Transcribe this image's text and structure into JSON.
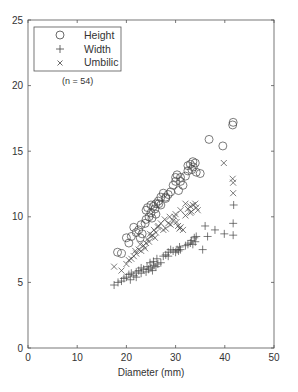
{
  "chart_data": {
    "type": "scatter",
    "title": "",
    "xlabel": "Diameter (mm)",
    "ylabel": "",
    "xlim": [
      0,
      50
    ],
    "ylim": [
      0,
      25
    ],
    "xticks": [
      0,
      10,
      20,
      30,
      40,
      50
    ],
    "yticks": [
      0,
      5,
      10,
      15,
      20,
      25
    ],
    "grid": false,
    "legend_position": "upper-left",
    "annotation": "(n = 54)",
    "series": [
      {
        "name": "Height",
        "marker": "circle",
        "points": [
          [
            18.2,
            7.3
          ],
          [
            19.0,
            7.2
          ],
          [
            20.0,
            8.4
          ],
          [
            20.5,
            8.0
          ],
          [
            21.0,
            8.5
          ],
          [
            21.5,
            9.2
          ],
          [
            22.0,
            8.8
          ],
          [
            22.5,
            9.0
          ],
          [
            23.0,
            9.4
          ],
          [
            23.2,
            8.7
          ],
          [
            23.8,
            9.5
          ],
          [
            24.0,
            9.8
          ],
          [
            24.3,
            10.7
          ],
          [
            24.6,
            10.0
          ],
          [
            25.0,
            10.3
          ],
          [
            25.2,
            9.9
          ],
          [
            25.5,
            10.8
          ],
          [
            25.8,
            10.6
          ],
          [
            26.0,
            11.0
          ],
          [
            26.5,
            11.2
          ],
          [
            27.0,
            11.5
          ],
          [
            27.5,
            11.8
          ],
          [
            28.0,
            11.4
          ],
          [
            28.5,
            11.7
          ],
          [
            29.0,
            11.9
          ],
          [
            29.5,
            12.4
          ],
          [
            30.0,
            12.7
          ],
          [
            30.3,
            13.2
          ],
          [
            30.6,
            12.0
          ],
          [
            31.0,
            13.0
          ],
          [
            31.5,
            12.4
          ],
          [
            32.0,
            13.1
          ],
          [
            32.5,
            13.5
          ],
          [
            33.0,
            14.0
          ],
          [
            33.3,
            13.6
          ],
          [
            33.6,
            13.8
          ],
          [
            34.0,
            14.1
          ],
          [
            34.2,
            13.4
          ],
          [
            35.0,
            13.3
          ],
          [
            36.8,
            15.9
          ],
          [
            39.6,
            15.4
          ],
          [
            41.6,
            17.0
          ],
          [
            41.7,
            17.2
          ],
          [
            24.0,
            10.5
          ],
          [
            25.0,
            10.9
          ],
          [
            26.0,
            10.2
          ],
          [
            27.0,
            10.9
          ],
          [
            28.0,
            11.5
          ],
          [
            30.0,
            13.0
          ],
          [
            31.0,
            12.7
          ],
          [
            32.5,
            13.9
          ],
          [
            33.5,
            14.2
          ],
          [
            22.8,
            8.4
          ],
          [
            26.6,
            11.0
          ]
        ]
      },
      {
        "name": "Width",
        "marker": "plus",
        "points": [
          [
            17.5,
            4.8
          ],
          [
            18.3,
            5.0
          ],
          [
            19.0,
            5.1
          ],
          [
            19.5,
            5.3
          ],
          [
            20.0,
            5.4
          ],
          [
            20.5,
            5.6
          ],
          [
            21.0,
            5.7
          ],
          [
            21.5,
            5.5
          ],
          [
            22.0,
            5.8
          ],
          [
            22.5,
            5.9
          ],
          [
            23.0,
            5.7
          ],
          [
            23.5,
            6.0
          ],
          [
            24.0,
            5.8
          ],
          [
            24.2,
            6.2
          ],
          [
            24.5,
            6.0
          ],
          [
            25.0,
            6.1
          ],
          [
            25.3,
            5.9
          ],
          [
            25.6,
            6.3
          ],
          [
            26.0,
            6.2
          ],
          [
            26.4,
            6.4
          ],
          [
            27.0,
            6.5
          ],
          [
            27.5,
            7.0
          ],
          [
            28.0,
            7.1
          ],
          [
            28.5,
            7.3
          ],
          [
            29.0,
            7.5
          ],
          [
            30.0,
            7.3
          ],
          [
            30.3,
            7.5
          ],
          [
            30.6,
            7.4
          ],
          [
            31.0,
            7.5
          ],
          [
            32.0,
            7.8
          ],
          [
            32.5,
            7.9
          ],
          [
            33.0,
            8.0
          ],
          [
            33.2,
            8.2
          ],
          [
            33.5,
            7.9
          ],
          [
            34.0,
            8.1
          ],
          [
            34.2,
            8.5
          ],
          [
            35.5,
            7.5
          ],
          [
            36.5,
            8.5
          ],
          [
            38.0,
            9.0
          ],
          [
            39.9,
            8.7
          ],
          [
            41.7,
            8.6
          ],
          [
            41.7,
            9.5
          ],
          [
            41.8,
            10.9
          ],
          [
            36.0,
            9.3
          ],
          [
            23.0,
            6.1
          ],
          [
            24.8,
            6.5
          ],
          [
            26.2,
            6.8
          ],
          [
            22.0,
            5.4
          ],
          [
            28.5,
            7.0
          ],
          [
            33.8,
            8.4
          ],
          [
            20.8,
            5.2
          ],
          [
            25.5,
            6.6
          ],
          [
            30.8,
            7.7
          ],
          [
            29.5,
            7.4
          ]
        ]
      },
      {
        "name": "Umbilic",
        "marker": "x",
        "points": [
          [
            17.5,
            6.2
          ],
          [
            19.0,
            5.9
          ],
          [
            20.0,
            6.4
          ],
          [
            20.5,
            6.7
          ],
          [
            21.0,
            6.8
          ],
          [
            21.5,
            7.0
          ],
          [
            22.0,
            7.2
          ],
          [
            22.5,
            7.5
          ],
          [
            23.0,
            7.4
          ],
          [
            23.5,
            7.8
          ],
          [
            24.0,
            8.0
          ],
          [
            24.3,
            8.3
          ],
          [
            24.6,
            8.1
          ],
          [
            25.0,
            8.5
          ],
          [
            25.3,
            8.6
          ],
          [
            25.6,
            9.0
          ],
          [
            26.0,
            8.8
          ],
          [
            26.4,
            9.2
          ],
          [
            27.0,
            9.5
          ],
          [
            27.5,
            9.0
          ],
          [
            28.0,
            9.1
          ],
          [
            28.5,
            9.5
          ],
          [
            29.0,
            9.4
          ],
          [
            29.5,
            9.7
          ],
          [
            30.0,
            10.2
          ],
          [
            30.5,
            9.3
          ],
          [
            30.8,
            9.1
          ],
          [
            31.0,
            9.2
          ],
          [
            31.5,
            9.0
          ],
          [
            32.0,
            10.1
          ],
          [
            32.5,
            10.6
          ],
          [
            33.0,
            10.8
          ],
          [
            33.2,
            10.4
          ],
          [
            33.5,
            10.9
          ],
          [
            34.0,
            11.0
          ],
          [
            34.2,
            10.7
          ],
          [
            31.0,
            10.5
          ],
          [
            32.0,
            11.0
          ],
          [
            39.8,
            14.1
          ],
          [
            41.6,
            12.9
          ],
          [
            41.7,
            12.6
          ],
          [
            41.7,
            11.8
          ],
          [
            26.5,
            9.3
          ],
          [
            22.8,
            7.9
          ],
          [
            24.8,
            8.7
          ],
          [
            27.8,
            9.8
          ],
          [
            28.8,
            10.0
          ],
          [
            29.8,
            10.0
          ],
          [
            33.0,
            10.3
          ],
          [
            25.8,
            8.4
          ],
          [
            23.8,
            7.6
          ],
          [
            21.8,
            7.4
          ],
          [
            30.2,
            9.6
          ],
          [
            34.5,
            10.5
          ]
        ]
      }
    ]
  },
  "legend": {
    "items": [
      {
        "label": "Height",
        "marker": "circle"
      },
      {
        "label": "Width",
        "marker": "plus"
      },
      {
        "label": "Umbilic",
        "marker": "x"
      }
    ]
  },
  "annotation": "(n = 54)",
  "axes": {
    "xlabel": "Diameter (mm)",
    "xticks": [
      "0",
      "10",
      "20",
      "30",
      "40",
      "50"
    ],
    "yticks": [
      "0",
      "5",
      "10",
      "15",
      "20",
      "25"
    ]
  }
}
